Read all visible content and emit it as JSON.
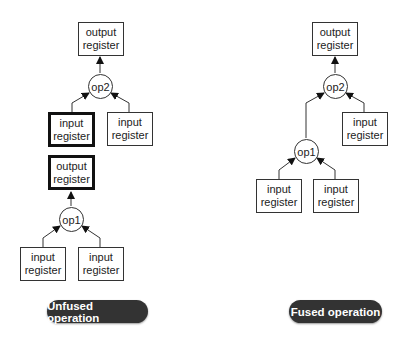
{
  "diagrams": {
    "unfused": {
      "label": "Unfused operation",
      "nodes": {
        "out2": {
          "line1": "output",
          "line2": "register"
        },
        "op2": {
          "label": "op2"
        },
        "in_mid": {
          "line1": "input",
          "line2": "register"
        },
        "in_right": {
          "line1": "input",
          "line2": "register"
        },
        "out1": {
          "line1": "output",
          "line2": "register"
        },
        "op1": {
          "label": "op1"
        },
        "in_a": {
          "line1": "input",
          "line2": "register"
        },
        "in_b": {
          "line1": "input",
          "line2": "register"
        }
      }
    },
    "fused": {
      "label": "Fused operation",
      "nodes": {
        "out": {
          "line1": "output",
          "line2": "register"
        },
        "op2": {
          "label": "op2"
        },
        "in_right": {
          "line1": "input",
          "line2": "register"
        },
        "op1": {
          "label": "op1"
        },
        "in_a": {
          "line1": "input",
          "line2": "register"
        },
        "in_b": {
          "line1": "input",
          "line2": "register"
        }
      }
    }
  },
  "colors": {
    "stroke": "#333333",
    "pill_bg": "#333333",
    "pill_text": "#ffffff"
  }
}
